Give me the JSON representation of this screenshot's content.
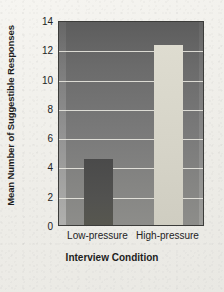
{
  "chart_data": {
    "type": "bar",
    "title": "",
    "categories": [
      "Low-pressure",
      "High-pressure"
    ],
    "values": [
      4.5,
      12.3
    ],
    "xlabel": "Interview Condition",
    "ylabel": "Mean Number of Suggestible Responses",
    "ylim": [
      0,
      14
    ],
    "yticks": [
      0,
      2,
      4,
      6,
      8,
      10,
      12,
      14
    ],
    "ytick_labels": [
      "0",
      "2",
      "4",
      "6",
      "8",
      "10",
      "12",
      "14"
    ],
    "grid": "horizontal",
    "legend": "none",
    "bar_colors": [
      "#52524f",
      "#dcdacd"
    ],
    "plot_background": "#75757_3",
    "figure_background": "#f1f0ec",
    "gridline_color": "#eceae2"
  }
}
